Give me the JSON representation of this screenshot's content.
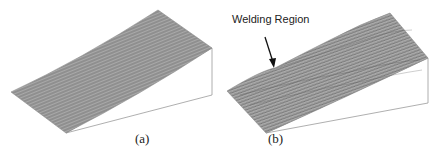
{
  "figure": {
    "panels": [
      {
        "id": "a",
        "label": "(a)",
        "description": "3D mesh surface plot, smooth inclined surface"
      },
      {
        "id": "b",
        "label": "(b)",
        "description": "3D mesh surface plot, inclined surface with distortion",
        "annotation": "Welding Region"
      }
    ]
  },
  "colors": {
    "mesh": "#8f8f8f",
    "mesh_line": "#6a6a6a",
    "outline": "#9a9a9a",
    "text": "#222222"
  }
}
